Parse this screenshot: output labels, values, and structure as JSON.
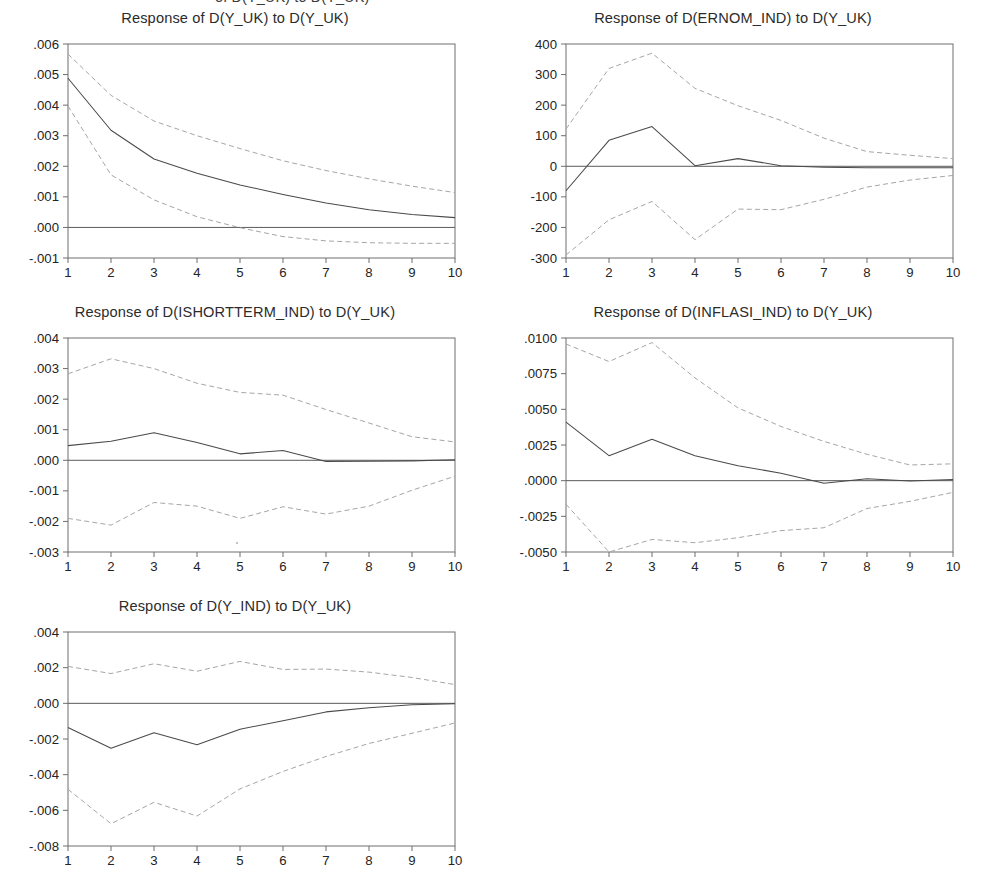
{
  "figure": {
    "clipped_header_text": "of D(Y_UK) to D(Y_UK)",
    "x_tick_labels": [
      "1",
      "2",
      "3",
      "4",
      "5",
      "6",
      "7",
      "8",
      "9",
      "10"
    ],
    "line_colors": {
      "mean": "#4a4a4a",
      "confidence_band": "#a6a6a6",
      "axis": "#6e6e6e",
      "zero_line": "#5a5a5a"
    }
  },
  "panels": [
    {
      "title": "Response of D(Y_UK) to D(Y_UK)",
      "y_tick_labels": [
        ".006",
        ".005",
        ".004",
        ".003",
        ".002",
        ".001",
        ".000",
        "-.001"
      ]
    },
    {
      "title": "Response of D(ERNOM_IND) to D(Y_UK)",
      "y_tick_labels": [
        "400",
        "300",
        "200",
        "100",
        "0",
        "-100",
        "-200",
        "-300"
      ]
    },
    {
      "title": "Response of D(ISHORTTERM_IND) to D(Y_UK)",
      "y_tick_labels": [
        ".004",
        ".003",
        ".002",
        ".001",
        ".000",
        "-.001",
        "-.002",
        "-.003"
      ]
    },
    {
      "title": "Response of D(INFLASI_IND) to D(Y_UK)",
      "y_tick_labels": [
        ".0100",
        ".0075",
        ".0050",
        ".0025",
        ".0000",
        "-.0025",
        "-.0050"
      ]
    },
    {
      "title": "Response of D(Y_IND) to D(Y_UK)",
      "y_tick_labels": [
        ".004",
        ".002",
        ".000",
        "-.002",
        "-.004",
        "-.006",
        "-.008"
      ]
    }
  ],
  "chart_data": [
    {
      "type": "line",
      "title": "Response of D(Y_UK) to D(Y_UK)",
      "xlabel": "",
      "ylabel": "",
      "x": [
        1,
        2,
        3,
        4,
        5,
        6,
        7,
        8,
        9,
        10
      ],
      "xlim": [
        1,
        10
      ],
      "ylim": [
        -0.001,
        0.006
      ],
      "yticks": [
        0.006,
        0.005,
        0.004,
        0.003,
        0.002,
        0.001,
        0.0,
        -0.001
      ],
      "ytick_labels": [
        ".006",
        ".005",
        ".004",
        ".003",
        ".002",
        ".001",
        ".000",
        "-.001"
      ],
      "grid": false,
      "legend": "none",
      "zero_line": 0.0,
      "series": [
        {
          "name": "Response",
          "style": "solid",
          "values": [
            0.00488,
            0.00318,
            0.00224,
            0.00177,
            0.00139,
            0.00108,
            0.0008,
            0.00058,
            0.00042,
            0.00032
          ]
        },
        {
          "name": "Upper 2 S.E.",
          "style": "dashed",
          "values": [
            0.00567,
            0.00432,
            0.00348,
            0.003,
            0.00258,
            0.00218,
            0.00186,
            0.00159,
            0.00135,
            0.00114
          ]
        },
        {
          "name": "Lower 2 S.E.",
          "style": "dashed",
          "values": [
            0.00397,
            0.00172,
            0.0009,
            0.00035,
            -1e-05,
            -0.0003,
            -0.00044,
            -0.0005,
            -0.00052,
            -0.00052
          ]
        }
      ]
    },
    {
      "type": "line",
      "title": "Response of D(ERNOM_IND) to D(Y_UK)",
      "xlabel": "",
      "ylabel": "",
      "x": [
        1,
        2,
        3,
        4,
        5,
        6,
        7,
        8,
        9,
        10
      ],
      "xlim": [
        1,
        10
      ],
      "ylim": [
        -300,
        400
      ],
      "yticks": [
        400,
        300,
        200,
        100,
        0,
        -100,
        -200,
        -300
      ],
      "ytick_labels": [
        "400",
        "300",
        "200",
        "100",
        "0",
        "-100",
        "-200",
        "-300"
      ],
      "grid": false,
      "legend": "none",
      "zero_line": 0,
      "series": [
        {
          "name": "Response",
          "style": "solid",
          "values": [
            -80,
            85,
            130,
            2,
            25,
            2,
            -3,
            -5,
            -5,
            -5
          ]
        },
        {
          "name": "Upper 2 S.E.",
          "style": "dashed",
          "values": [
            122,
            320,
            370,
            255,
            198,
            150,
            92,
            48,
            36,
            25
          ]
        },
        {
          "name": "Lower 2 S.E.",
          "style": "dashed",
          "values": [
            -290,
            -175,
            -115,
            -240,
            -140,
            -142,
            -108,
            -68,
            -45,
            -30
          ]
        }
      ]
    },
    {
      "type": "line",
      "title": "Response of D(ISHORTTERM_IND) to D(Y_UK)",
      "xlabel": "",
      "ylabel": "",
      "x": [
        1,
        2,
        3,
        4,
        5,
        6,
        7,
        8,
        9,
        10
      ],
      "xlim": [
        1,
        10
      ],
      "ylim": [
        -0.003,
        0.004
      ],
      "yticks": [
        0.004,
        0.003,
        0.002,
        0.001,
        0.0,
        -0.001,
        -0.002,
        -0.003
      ],
      "ytick_labels": [
        ".004",
        ".003",
        ".002",
        ".001",
        ".000",
        "-.001",
        "-.002",
        "-.003"
      ],
      "grid": false,
      "legend": "none",
      "zero_line": 0.0,
      "series": [
        {
          "name": "Response",
          "style": "solid",
          "values": [
            0.00048,
            0.00062,
            0.0009,
            0.00058,
            0.00021,
            0.00032,
            -4e-05,
            -3e-05,
            -2e-05,
            2e-05
          ]
        },
        {
          "name": "Upper 2 S.E.",
          "style": "dashed",
          "values": [
            0.00283,
            0.00332,
            0.003,
            0.00252,
            0.00222,
            0.00213,
            0.00166,
            0.00122,
            0.00077,
            0.0006
          ]
        },
        {
          "name": "Lower 2 S.E.",
          "style": "dashed",
          "values": [
            -0.0019,
            -0.00212,
            -0.00138,
            -0.0015,
            -0.0019,
            -0.00152,
            -0.00176,
            -0.0015,
            -0.00098,
            -0.00052
          ]
        }
      ]
    },
    {
      "type": "line",
      "title": "Response of D(INFLASI_IND) to D(Y_UK)",
      "xlabel": "",
      "ylabel": "",
      "x": [
        1,
        2,
        3,
        4,
        5,
        6,
        7,
        8,
        9,
        10
      ],
      "xlim": [
        -0.005,
        0.01
      ],
      "ylim": [
        -0.005,
        0.01
      ],
      "yticks": [
        0.01,
        0.0075,
        0.005,
        0.0025,
        0.0,
        -0.0025,
        -0.005
      ],
      "ytick_labels": [
        ".0100",
        ".0075",
        ".0050",
        ".0025",
        ".0000",
        "-.0025",
        "-.0050"
      ],
      "grid": false,
      "legend": "none",
      "zero_line": 0.0,
      "series": [
        {
          "name": "Response",
          "style": "solid",
          "values": [
            0.0041,
            0.00175,
            0.0029,
            0.00175,
            0.00105,
            0.00052,
            -0.00018,
            0.00013,
            -3e-05,
            8e-05
          ]
        },
        {
          "name": "Upper 2 S.E.",
          "style": "dashed",
          "values": [
            0.00958,
            0.00835,
            0.00968,
            0.0072,
            0.0051,
            0.0038,
            0.00275,
            0.00185,
            0.0011,
            0.00118
          ]
        },
        {
          "name": "Lower 2 S.E.",
          "style": "dashed",
          "values": [
            -0.00165,
            -0.005,
            -0.00412,
            -0.00435,
            -0.004,
            -0.0035,
            -0.0033,
            -0.00195,
            -0.00145,
            -0.00082
          ]
        }
      ]
    },
    {
      "type": "line",
      "title": "Response of D(Y_IND) to D(Y_UK)",
      "xlabel": "",
      "ylabel": "",
      "x": [
        1,
        2,
        3,
        4,
        5,
        6,
        7,
        8,
        9,
        10
      ],
      "xlim": [
        1,
        10
      ],
      "ylim": [
        -0.008,
        0.004
      ],
      "yticks": [
        0.004,
        0.002,
        0.0,
        -0.002,
        -0.004,
        -0.006,
        -0.008
      ],
      "ytick_labels": [
        ".004",
        ".002",
        ".000",
        "-.002",
        "-.004",
        "-.006",
        "-.008"
      ],
      "grid": false,
      "legend": "none",
      "zero_line": 0.0,
      "series": [
        {
          "name": "Response",
          "style": "solid",
          "values": [
            -0.00135,
            -0.00252,
            -0.00165,
            -0.00232,
            -0.00145,
            -0.00098,
            -0.00048,
            -0.00025,
            -8e-05,
            -2e-05
          ]
        },
        {
          "name": "Upper 2 S.E.",
          "style": "dashed",
          "values": [
            0.00207,
            0.00167,
            0.00222,
            0.0018,
            0.00235,
            0.0019,
            0.00192,
            0.00175,
            0.00145,
            0.00105
          ]
        },
        {
          "name": "Lower 2 S.E.",
          "style": "dashed",
          "values": [
            -0.00482,
            -0.00675,
            -0.00555,
            -0.00632,
            -0.0048,
            -0.00382,
            -0.00298,
            -0.00225,
            -0.00168,
            -0.0011
          ]
        }
      ]
    }
  ]
}
